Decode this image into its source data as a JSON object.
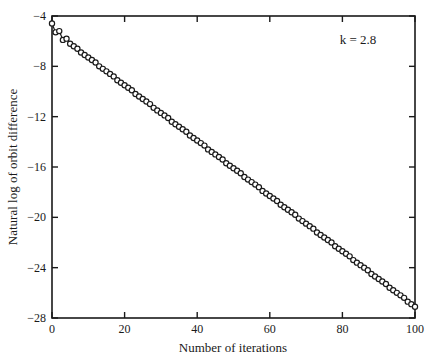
{
  "chart_data": {
    "type": "scatter",
    "title": "",
    "xlabel": "Number of iterations",
    "ylabel": "Natural log of orbit difference",
    "annotation": "k = 2.8",
    "xlim": [
      0,
      100
    ],
    "ylim": [
      -28,
      -4
    ],
    "xticks": [
      0,
      20,
      40,
      60,
      80,
      100
    ],
    "yticks": [
      -4,
      -8,
      -12,
      -16,
      -20,
      -24,
      -28
    ],
    "xtick_labels": [
      "0",
      "20",
      "40",
      "60",
      "80",
      "100"
    ],
    "ytick_labels": [
      "−4",
      "−8",
      "−12",
      "−16",
      "−20",
      "−24",
      "−28"
    ],
    "grid": false,
    "legend": null,
    "marker": "open-circle",
    "line": "solid",
    "series": [
      {
        "name": "k = 2.8",
        "x": [
          0,
          1,
          2,
          3,
          4,
          5,
          6,
          7,
          8,
          9,
          10,
          11,
          12,
          13,
          14,
          15,
          16,
          17,
          18,
          19,
          20,
          21,
          22,
          23,
          24,
          25,
          26,
          27,
          28,
          29,
          30,
          31,
          32,
          33,
          34,
          35,
          36,
          37,
          38,
          39,
          40,
          41,
          42,
          43,
          44,
          45,
          46,
          47,
          48,
          49,
          50,
          51,
          52,
          53,
          54,
          55,
          56,
          57,
          58,
          59,
          60,
          61,
          62,
          63,
          64,
          65,
          66,
          67,
          68,
          69,
          70,
          71,
          72,
          73,
          74,
          75,
          76,
          77,
          78,
          79,
          80,
          81,
          82,
          83,
          84,
          85,
          86,
          87,
          88,
          89,
          90,
          91,
          92,
          93,
          94,
          95,
          96,
          97,
          98,
          99,
          100
        ],
        "values": [
          -4.6,
          -5.3,
          -5.2,
          -5.9,
          -5.8,
          -6.2,
          -6.4,
          -6.6,
          -6.9,
          -7.1,
          -7.3,
          -7.5,
          -7.7,
          -8.0,
          -8.2,
          -8.4,
          -8.6,
          -8.8,
          -9.1,
          -9.3,
          -9.5,
          -9.7,
          -9.9,
          -10.2,
          -10.4,
          -10.6,
          -10.8,
          -11.0,
          -11.3,
          -11.5,
          -11.7,
          -11.9,
          -12.1,
          -12.4,
          -12.6,
          -12.8,
          -13.0,
          -13.2,
          -13.5,
          -13.7,
          -13.9,
          -14.1,
          -14.3,
          -14.6,
          -14.8,
          -15.0,
          -15.2,
          -15.4,
          -15.7,
          -15.9,
          -16.1,
          -16.3,
          -16.5,
          -16.8,
          -17.0,
          -17.2,
          -17.4,
          -17.6,
          -17.9,
          -18.1,
          -18.3,
          -18.5,
          -18.7,
          -19.0,
          -19.2,
          -19.4,
          -19.6,
          -19.8,
          -20.1,
          -20.3,
          -20.5,
          -20.7,
          -20.9,
          -21.2,
          -21.4,
          -21.6,
          -21.8,
          -22.0,
          -22.3,
          -22.5,
          -22.7,
          -22.9,
          -23.1,
          -23.4,
          -23.6,
          -23.8,
          -24.0,
          -24.2,
          -24.5,
          -24.7,
          -24.9,
          -25.1,
          -25.3,
          -25.6,
          -25.8,
          -26.0,
          -26.2,
          -26.4,
          -26.7,
          -26.9,
          -27.1
        ]
      }
    ],
    "colors": {
      "frame": "#1a1a1a",
      "marker": "#1a1a1a",
      "background": "#ffffff"
    }
  }
}
